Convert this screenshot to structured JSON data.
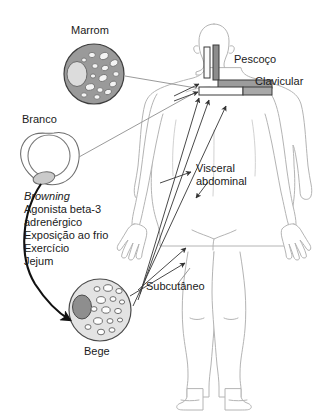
{
  "figure": {
    "title_absent": true,
    "language": "pt-BR"
  },
  "cells": [
    {
      "id": "brown",
      "label": "Marrom",
      "fill": "#9a9a9a",
      "stroke": "#3a3a3a",
      "nucleus_fill": "#dcdcdc",
      "droplet_fill": "#f2f2f2"
    },
    {
      "id": "white",
      "label": "Branco",
      "fill": "#ffffff",
      "stroke": "#6e6e6e",
      "nucleus_fill": "#c9c9c9",
      "droplet_fill": "#ffffff"
    },
    {
      "id": "beige",
      "label": "Bege",
      "fill": "#e3e3e3",
      "stroke": "#4a4a4a",
      "nucleus_fill": "#8e8e8e",
      "droplet_fill": "#ffffff"
    }
  ],
  "browning": {
    "heading": "Browning",
    "items": [
      "Agonista beta-3",
      "adrenérgico",
      "Exposição ao frio",
      "Exercício",
      "Jejum"
    ]
  },
  "depots": [
    {
      "id": "neck",
      "label": "Pescoço"
    },
    {
      "id": "clavicular",
      "label": "Clavicular"
    },
    {
      "id": "visceral",
      "label_line1": "Visceral",
      "label_line2": "abdominal"
    },
    {
      "id": "subcutaneous",
      "label": "Subcutâneo"
    }
  ],
  "markers": {
    "neck_bar_light_fill": "#fbfbfb",
    "neck_bar_dark_fill": "#8c8c8c",
    "clavicular_bar_dark_fill": "#9c9c9c",
    "clavicular_bar_light_fill": "#ffffff",
    "bar_stroke": "#3a3a3a"
  },
  "body_figure": {
    "outline_stroke": "#b4b4b4",
    "fill": "#ffffff"
  },
  "arrows": {
    "thin_stroke": "#4a4a4a",
    "thick_stroke": "#111111",
    "leader_stroke": "#9a9a9a"
  }
}
